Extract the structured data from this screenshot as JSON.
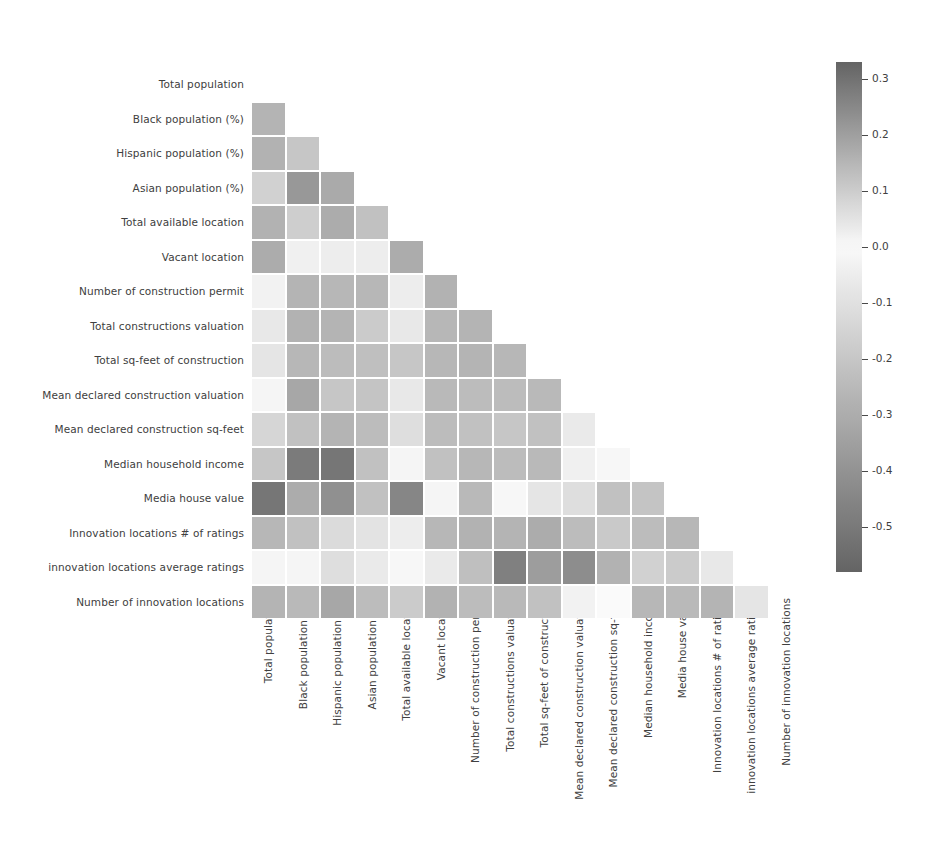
{
  "chart_data": {
    "type": "heatmap",
    "title": "",
    "xlabel": "",
    "ylabel": "",
    "grid": false,
    "mask": "lower-triangle-excluding-diagonal",
    "colormap": "diverging-grayscale",
    "colorbar": {
      "position": "right",
      "vmin": -0.58,
      "vmax": 0.33,
      "center": 0.0,
      "ticks": [
        0.3,
        0.2,
        0.1,
        0.0,
        -0.1,
        -0.2,
        -0.3,
        -0.4,
        -0.5
      ],
      "ticklabels": [
        "0.3",
        "0.2",
        "0.1",
        "0.0",
        "-0.1",
        "-0.2",
        "-0.3",
        "-0.4",
        "-0.5"
      ]
    },
    "categories": [
      "Total population",
      "Black population (%)",
      "Hispanic population (%)",
      "Asian population (%)",
      "Total available location",
      "Vacant location",
      "Number of construction permit",
      "Total constructions valuation",
      "Total sq-feet of construction",
      "Mean declared construction valuation",
      "Mean declared construction sq-feet",
      "Median household income",
      "Media house value",
      "Innovation locations # of ratings",
      "innovation locations average ratings",
      "Number of innovation locations"
    ],
    "xticklabels": [
      "Total population",
      "Black population (%)",
      "Hispanic population (%)",
      "Asian population (%)",
      "Total available location",
      "Vacant location",
      "Number of construction permit",
      "Total constructions valuation",
      "Total sq-feet of construction",
      "Mean declared construction valuation",
      "Mean declared construction sq-feet",
      "Median household income",
      "Media house value",
      "Innovation locations # of ratings",
      "innovation locations average ratings",
      "Number of innovation locations"
    ],
    "yticklabels": [
      "Total population",
      "Black population (%)",
      "Hispanic population (%)",
      "Asian population (%)",
      "Total available location",
      "Vacant location",
      "Number of construction permit",
      "Total constructions valuation",
      "Total sq-feet of construction",
      "Mean declared construction valuation",
      "Mean declared construction sq-feet",
      "Median household income",
      "Media house value",
      "Innovation locations # of ratings",
      "innovation locations average ratings",
      "Number of innovation locations"
    ],
    "matrix": [
      [
        null,
        null,
        null,
        null,
        null,
        null,
        null,
        null,
        null,
        null,
        null,
        null,
        null,
        null,
        null,
        null
      ],
      [
        -0.27,
        null,
        null,
        null,
        null,
        null,
        null,
        null,
        null,
        null,
        null,
        null,
        null,
        null,
        null,
        null
      ],
      [
        -0.28,
        -0.2,
        null,
        null,
        null,
        null,
        null,
        null,
        null,
        null,
        null,
        null,
        null,
        null,
        null,
        null
      ],
      [
        -0.16,
        -0.38,
        -0.31,
        null,
        null,
        null,
        null,
        null,
        null,
        null,
        null,
        null,
        null,
        null,
        null,
        null
      ],
      [
        -0.28,
        -0.17,
        -0.3,
        -0.22,
        null,
        null,
        null,
        null,
        null,
        null,
        null,
        null,
        null,
        null,
        null,
        null
      ],
      [
        -0.3,
        -0.04,
        -0.05,
        -0.05,
        -0.3,
        null,
        null,
        null,
        null,
        null,
        null,
        null,
        null,
        null,
        null,
        null
      ],
      [
        -0.03,
        -0.27,
        -0.26,
        -0.26,
        -0.05,
        -0.28,
        null,
        null,
        null,
        null,
        null,
        null,
        null,
        null,
        null,
        null
      ],
      [
        0.04,
        -0.28,
        -0.27,
        -0.18,
        -0.07,
        -0.26,
        -0.27,
        null,
        null,
        null,
        null,
        null,
        null,
        null,
        null,
        null
      ],
      [
        -0.08,
        -0.26,
        -0.24,
        -0.23,
        -0.2,
        -0.26,
        -0.27,
        -0.26,
        null,
        null,
        null,
        null,
        null,
        null,
        null,
        null
      ],
      [
        -0.02,
        -0.32,
        -0.2,
        -0.21,
        -0.07,
        -0.25,
        -0.24,
        -0.24,
        -0.25,
        null,
        null,
        null,
        null,
        null,
        null,
        null
      ],
      [
        -0.14,
        -0.22,
        -0.27,
        -0.24,
        -0.11,
        -0.24,
        -0.22,
        -0.2,
        -0.22,
        -0.06,
        null,
        null,
        null,
        null,
        null,
        null
      ],
      [
        -0.2,
        -0.49,
        -0.51,
        -0.22,
        -0.02,
        -0.22,
        -0.26,
        -0.24,
        -0.25,
        -0.04,
        -0.01,
        null,
        null,
        null,
        null,
        null
      ],
      [
        -0.51,
        -0.3,
        -0.41,
        -0.22,
        -0.45,
        -0.02,
        -0.25,
        -0.01,
        -0.08,
        -0.11,
        -0.22,
        -0.21,
        null,
        null,
        null,
        null
      ],
      [
        -0.26,
        -0.22,
        -0.12,
        -0.09,
        -0.05,
        -0.26,
        -0.28,
        -0.27,
        -0.3,
        -0.24,
        -0.19,
        -0.24,
        -0.26,
        null,
        null,
        null
      ],
      [
        -0.02,
        -0.02,
        -0.11,
        -0.06,
        -0.01,
        -0.06,
        -0.23,
        -0.47,
        -0.36,
        -0.42,
        -0.28,
        -0.16,
        -0.18,
        -0.07,
        null,
        null
      ],
      [
        -0.27,
        -0.25,
        -0.32,
        -0.24,
        -0.18,
        -0.28,
        -0.24,
        -0.25,
        -0.22,
        -0.03,
        0.0,
        -0.26,
        -0.25,
        -0.27,
        -0.08,
        null
      ]
    ]
  },
  "layout": {
    "cell_size": 34.5,
    "grid_left": 252,
    "grid_top": 68,
    "row_pitch": 34.5,
    "colorbar_left": 836,
    "colorbar_top": 62,
    "colorbar_height": 510,
    "colorbar_width": 26
  }
}
